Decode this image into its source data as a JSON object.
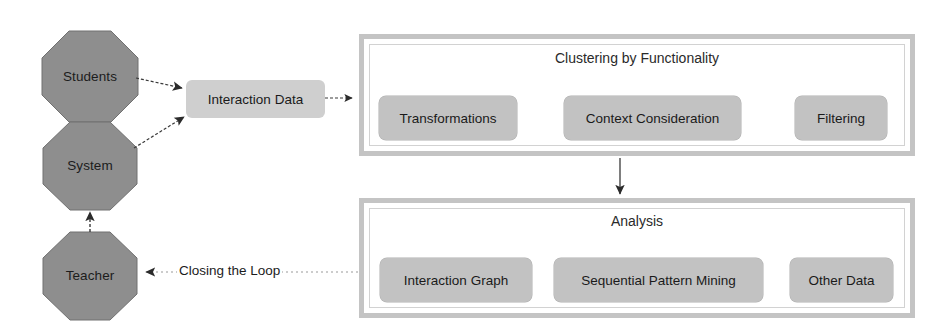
{
  "diagram": {
    "colors": {
      "actor_fill": "#8e8e8e",
      "actor_stroke": "#6f6f6f",
      "chip_fill": "#c2c2c2",
      "chip_fill_soft": "#cfcfcf",
      "frame_border": "#c4c4c4",
      "frame_inner_border": "#d2d2d2",
      "arrow": "#2b2b2b",
      "text": "#1c1c1c",
      "background": "#ffffff"
    },
    "actors": [
      {
        "id": "students",
        "label": "Students",
        "shape": "octagon"
      },
      {
        "id": "system",
        "label": "System",
        "shape": "octagon"
      },
      {
        "id": "teacher",
        "label": "Teacher",
        "shape": "octagon"
      }
    ],
    "data_node": {
      "id": "interaction-data",
      "label": "Interaction Data"
    },
    "groups": [
      {
        "id": "clustering",
        "title": "Clustering by Functionality",
        "items": [
          {
            "id": "transformations",
            "label": "Transformations"
          },
          {
            "id": "context-consideration",
            "label": "Context Consideration"
          },
          {
            "id": "filtering",
            "label": "Filtering"
          }
        ]
      },
      {
        "id": "analysis",
        "title": "Analysis",
        "items": [
          {
            "id": "interaction-graph",
            "label": "Interaction Graph"
          },
          {
            "id": "sequential-pattern-mining",
            "label": "Sequential Pattern Mining"
          },
          {
            "id": "other-data",
            "label": "Other Data"
          }
        ]
      }
    ],
    "edges": [
      {
        "id": "students-to-data",
        "from": "Students",
        "to": "Interaction Data",
        "label": "",
        "style": "solid"
      },
      {
        "id": "system-to-data",
        "from": "System",
        "to": "Interaction Data",
        "label": "",
        "style": "solid"
      },
      {
        "id": "teacher-to-system",
        "from": "Teacher",
        "to": "System",
        "label": "",
        "style": "solid"
      },
      {
        "id": "data-to-clustering",
        "from": "Interaction Data",
        "to": "Clustering by Functionality",
        "label": "",
        "style": "dashed"
      },
      {
        "id": "transformations-to-context",
        "from": "Transformations",
        "to": "Context Consideration",
        "label": "",
        "style": "dashed"
      },
      {
        "id": "context-to-filtering",
        "from": "Context Consideration",
        "to": "Filtering",
        "label": "",
        "style": "dashed"
      },
      {
        "id": "clustering-to-analysis",
        "from": "Clustering by Functionality",
        "to": "Analysis",
        "label": "",
        "style": "solid"
      },
      {
        "id": "analysis-to-teacher",
        "from": "Analysis",
        "to": "Teacher",
        "label": "Closing the Loop",
        "style": "dotted"
      }
    ],
    "loop_label": "Closing the Loop"
  }
}
